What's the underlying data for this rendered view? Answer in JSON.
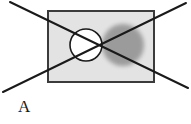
{
  "figure": {
    "label": "A",
    "caption_position": "below-left",
    "background_color": "#ffffff",
    "panel": {
      "name": "rectangle-panel",
      "fill_color": "#e3e3e3",
      "stroke_color": "#3b3b3b",
      "stroke_width": 2,
      "x": 47,
      "y": 10,
      "width": 108,
      "height": 73
    },
    "shapes": [
      {
        "name": "white-circle",
        "type": "circle",
        "fill_color": "#ffffff",
        "stroke_color": "#1a1a1a",
        "stroke_width": 1.6,
        "cx": 86,
        "cy": 45,
        "r": 16
      },
      {
        "name": "gray-blob",
        "type": "circle",
        "fill_color": "#989898",
        "stroke_color": "none",
        "blur": 2.2,
        "opacity": 0.95,
        "cx": 123,
        "cy": 45,
        "r": 21
      }
    ],
    "cross_lines": [
      {
        "name": "diagonal-line-down-right",
        "stroke_color": "#1a1a1a",
        "stroke_width": 2,
        "x1": 10,
        "y1": 2,
        "x2": 188,
        "y2": 88
      },
      {
        "name": "diagonal-line-up-right",
        "stroke_color": "#1a1a1a",
        "stroke_width": 2,
        "x1": 3,
        "y1": 92,
        "x2": 186,
        "y2": 3
      }
    ],
    "intersection_point": {
      "name": "x-crossing-point",
      "x": 102,
      "y": 45
    }
  }
}
